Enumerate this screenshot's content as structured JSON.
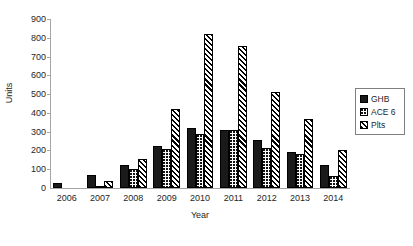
{
  "chart_data": {
    "type": "bar",
    "title": "",
    "xlabel": "Year",
    "ylabel": "Units",
    "categories": [
      "2006",
      "2007",
      "2008",
      "2009",
      "2010",
      "2011",
      "2012",
      "2013",
      "2014"
    ],
    "series": [
      {
        "name": "GHB",
        "pattern": "solid-black",
        "values": [
          25,
          70,
          120,
          225,
          320,
          310,
          255,
          190,
          125
        ]
      },
      {
        "name": "ACE 6",
        "pattern": "dotted",
        "values": [
          0,
          10,
          100,
          210,
          290,
          310,
          215,
          180,
          65
        ]
      },
      {
        "name": "Plts",
        "pattern": "diagonal-hatch",
        "values": [
          0,
          40,
          155,
          420,
          820,
          755,
          510,
          365,
          205
        ]
      }
    ],
    "ylim": [
      0,
      900
    ],
    "ytick_step": 100,
    "yticks": [
      "900",
      "800",
      "700",
      "600",
      "500",
      "400",
      "300",
      "200",
      "100",
      "0"
    ],
    "grid": false,
    "legend_position": "right-middle",
    "colors": {
      "bar_outline": "#000000",
      "ghb_fill": "#1a1a1a",
      "axis_line": "#a6a6a6",
      "text": "#262626",
      "background": "#ffffff",
      "legend_border": "#7f7f7f"
    }
  },
  "legend": {
    "items": [
      {
        "label": "GHB"
      },
      {
        "label": "ACE 6"
      },
      {
        "label": "Plts"
      }
    ]
  }
}
